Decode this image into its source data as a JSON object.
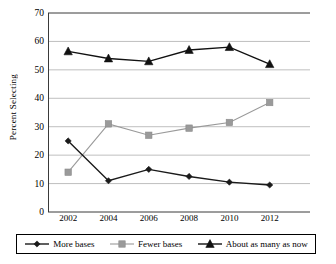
{
  "chart_data": {
    "type": "line",
    "title": "",
    "xlabel": "",
    "ylabel": "Percent Selecting",
    "x": [
      2002,
      2004,
      2006,
      2008,
      2010,
      2012
    ],
    "categories": [
      "2002",
      "2004",
      "2006",
      "2008",
      "2010",
      "2012"
    ],
    "xlim": [
      2001,
      2014
    ],
    "ylim": [
      0,
      70
    ],
    "ytick_values": [
      0,
      10,
      20,
      30,
      40,
      50,
      60,
      70
    ],
    "ytick_labels": [
      "0",
      "10",
      "20",
      "30",
      "40",
      "50",
      "60",
      "70"
    ],
    "grid": "horizontal",
    "legend_position": "below-axis",
    "series": [
      {
        "name": "More bases",
        "marker": "diamond",
        "color": "#1a1a1a",
        "values": [
          25,
          11,
          15,
          12.5,
          10.5,
          9.5
        ]
      },
      {
        "name": "Fewer bases",
        "marker": "square",
        "color": "#9a9a9a",
        "values": [
          14,
          31,
          27,
          29.5,
          31.5,
          38.5
        ]
      },
      {
        "name": "About as many as now",
        "marker": "triangle",
        "color": "#111111",
        "values": [
          56.5,
          54,
          53,
          57,
          58,
          52
        ]
      }
    ]
  },
  "legend": {
    "items": [
      {
        "label": "More bases",
        "marker": "diamond-marker-icon"
      },
      {
        "label": "Fewer bases",
        "marker": "square-marker-icon"
      },
      {
        "label": "About as many as now",
        "marker": "triangle-marker-icon"
      }
    ]
  }
}
